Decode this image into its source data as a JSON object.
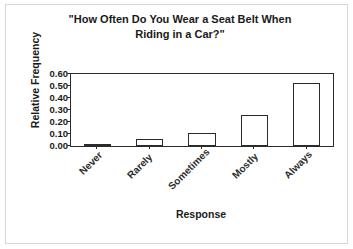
{
  "chart_data": {
    "type": "bar",
    "title": "\"How Often Do You Wear a Seat Belt When Riding in a Car?\"",
    "title_line1": "\"How Often Do You Wear a Seat Belt When",
    "title_line2": "Riding in a Car?\"",
    "xlabel": "Response",
    "ylabel": "Relative Frequency",
    "categories": [
      "Never",
      "Rarely",
      "Sometimes",
      "Mostly",
      "Always"
    ],
    "values": [
      0.02,
      0.06,
      0.11,
      0.26,
      0.525
    ],
    "ylim": [
      0.0,
      0.6
    ],
    "ytick_values": [
      0.0,
      0.1,
      0.2,
      0.3,
      0.4,
      0.5,
      0.6
    ],
    "ytick_labels": [
      "0.00",
      "0.10",
      "0.20",
      "0.30",
      "0.40",
      "0.50",
      "0.60"
    ],
    "grid": false,
    "legend": false,
    "bar_fill_color": "#ffffff",
    "bar_edge_color": "#2b2b2b",
    "frame_color": "#2b2b2b",
    "background_color": "#ffffff",
    "outer_border_color": "#d8d8d8",
    "category_label_rotation": -45
  }
}
